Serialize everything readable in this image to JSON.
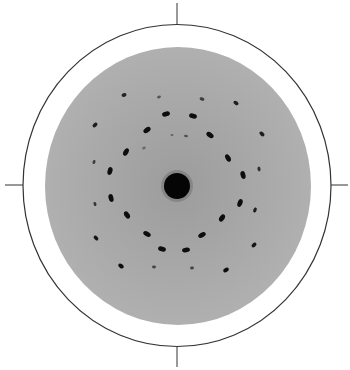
{
  "figure": {
    "type": "diffraction-pattern",
    "background_color": "#ffffff",
    "frame": {
      "center": [
        177,
        185.5
      ],
      "rx": 154,
      "ry": 161,
      "stroke": "#333333",
      "stroke_width": 1.2
    },
    "ticks": [
      {
        "name": "tick-top",
        "x1": 177,
        "y1": 3,
        "x2": 177,
        "y2": 24
      },
      {
        "name": "tick-bottom",
        "x1": 177,
        "y1": 347,
        "x2": 177,
        "y2": 367
      },
      {
        "name": "tick-left",
        "x1": 5,
        "y1": 185,
        "x2": 23,
        "y2": 185
      },
      {
        "name": "tick-right",
        "x1": 331,
        "y1": 185,
        "x2": 348,
        "y2": 185
      }
    ],
    "screen": {
      "center": [
        178,
        186
      ],
      "rx": 133,
      "ry": 139,
      "fill": "#a9a9a9"
    },
    "central_beam": {
      "center": [
        177,
        186
      ],
      "r": 13,
      "fill": "#050505"
    },
    "spots": [
      {
        "x": 124,
        "y": 95,
        "rx": 2.5,
        "ry": 1.8,
        "rot": -20,
        "o": 0.85
      },
      {
        "x": 159,
        "y": 97,
        "rx": 2,
        "ry": 1.3,
        "rot": -20,
        "o": 0.5
      },
      {
        "x": 202,
        "y": 99,
        "rx": 2.5,
        "ry": 1.6,
        "rot": 20,
        "o": 0.7
      },
      {
        "x": 236,
        "y": 103,
        "rx": 2.8,
        "ry": 1.8,
        "rot": 35,
        "o": 0.9
      },
      {
        "x": 166,
        "y": 114,
        "rx": 4,
        "ry": 2.4,
        "rot": -15,
        "o": 1
      },
      {
        "x": 193,
        "y": 116,
        "rx": 4,
        "ry": 2.4,
        "rot": 15,
        "o": 1
      },
      {
        "x": 147,
        "y": 130,
        "rx": 4,
        "ry": 2.4,
        "rot": -35,
        "o": 1
      },
      {
        "x": 210,
        "y": 135,
        "rx": 4,
        "ry": 2.4,
        "rot": 35,
        "o": 1
      },
      {
        "x": 172,
        "y": 135,
        "rx": 1.5,
        "ry": 1,
        "rot": 0,
        "o": 0.4
      },
      {
        "x": 186,
        "y": 136,
        "rx": 2,
        "ry": 1.2,
        "rot": 10,
        "o": 0.5
      },
      {
        "x": 262,
        "y": 134,
        "rx": 2.8,
        "ry": 1.8,
        "rot": 40,
        "o": 0.9
      },
      {
        "x": 95,
        "y": 125,
        "rx": 2.8,
        "ry": 1.8,
        "rot": -40,
        "o": 0.9
      },
      {
        "x": 126,
        "y": 152,
        "rx": 4,
        "ry": 2.4,
        "rot": -60,
        "o": 1
      },
      {
        "x": 228,
        "y": 158,
        "rx": 4,
        "ry": 2.4,
        "rot": 60,
        "o": 1
      },
      {
        "x": 144,
        "y": 148,
        "rx": 2,
        "ry": 1.2,
        "rot": -20,
        "o": 0.35
      },
      {
        "x": 94,
        "y": 162,
        "rx": 2,
        "ry": 1.4,
        "rot": -70,
        "o": 0.7
      },
      {
        "x": 110,
        "y": 171,
        "rx": 4,
        "ry": 2.4,
        "rot": -75,
        "o": 1
      },
      {
        "x": 243,
        "y": 175,
        "rx": 4,
        "ry": 2.4,
        "rot": 75,
        "o": 1
      },
      {
        "x": 259,
        "y": 169,
        "rx": 2.4,
        "ry": 1.5,
        "rot": 80,
        "o": 0.8
      },
      {
        "x": 111,
        "y": 198,
        "rx": 4,
        "ry": 2.4,
        "rot": 75,
        "o": 1
      },
      {
        "x": 240,
        "y": 203,
        "rx": 4,
        "ry": 2.4,
        "rot": -70,
        "o": 1
      },
      {
        "x": 255,
        "y": 210,
        "rx": 2.6,
        "ry": 1.6,
        "rot": -70,
        "o": 0.9
      },
      {
        "x": 95,
        "y": 204,
        "rx": 2,
        "ry": 1.4,
        "rot": 70,
        "o": 0.75
      },
      {
        "x": 127,
        "y": 215,
        "rx": 4,
        "ry": 2.4,
        "rot": 55,
        "o": 1
      },
      {
        "x": 222,
        "y": 218,
        "rx": 4,
        "ry": 2.4,
        "rot": -55,
        "o": 1
      },
      {
        "x": 96,
        "y": 238,
        "rx": 2.8,
        "ry": 1.8,
        "rot": 45,
        "o": 0.95
      },
      {
        "x": 147,
        "y": 234,
        "rx": 4,
        "ry": 2.4,
        "rot": 30,
        "o": 1
      },
      {
        "x": 202,
        "y": 235,
        "rx": 4,
        "ry": 2.4,
        "rot": -30,
        "o": 1
      },
      {
        "x": 254,
        "y": 245,
        "rx": 2.8,
        "ry": 1.8,
        "rot": -40,
        "o": 0.95
      },
      {
        "x": 162,
        "y": 249,
        "rx": 4,
        "ry": 2.4,
        "rot": 15,
        "o": 1
      },
      {
        "x": 186,
        "y": 250,
        "rx": 4,
        "ry": 2.4,
        "rot": -10,
        "o": 1
      },
      {
        "x": 121,
        "y": 266,
        "rx": 3,
        "ry": 2,
        "rot": 35,
        "o": 1
      },
      {
        "x": 154,
        "y": 267,
        "rx": 2,
        "ry": 1.4,
        "rot": 0,
        "o": 0.6
      },
      {
        "x": 192,
        "y": 268,
        "rx": 2,
        "ry": 1.4,
        "rot": -10,
        "o": 0.6
      },
      {
        "x": 226,
        "y": 270,
        "rx": 3,
        "ry": 2,
        "rot": -30,
        "o": 1
      }
    ]
  }
}
